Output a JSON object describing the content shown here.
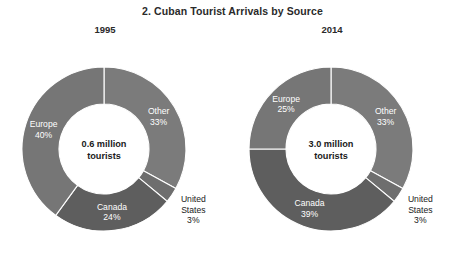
{
  "figure": {
    "title": "2. Cuban Tourist Arrivals by Source",
    "background_color": "#ffffff"
  },
  "chart_data": {
    "type": "pie",
    "title": "2. Cuban Tourist Arrivals by Source",
    "subtype": "donut",
    "legend": "none (direct slice labels)",
    "grid": false,
    "units": "percent of arrivals",
    "charts": [
      {
        "panel_label": "1995",
        "center_text_line1": "0.6 million",
        "center_text_line2": "tourists",
        "total_value": 0.6,
        "total_units": "million tourists",
        "categories": [
          "Other",
          "United States",
          "Canada",
          "Europe"
        ],
        "values": [
          33,
          3,
          24,
          40
        ],
        "slices": [
          {
            "name": "Other",
            "value": 33,
            "label": "Other",
            "value_label": "33%",
            "color": "#7b7b7b",
            "label_color": "#ffffff",
            "label_placement": "inside"
          },
          {
            "name": "United States",
            "value": 3,
            "label_line1": "United",
            "label_line2": "States",
            "value_label": "3%",
            "color": "#6e6e6e",
            "label_color": "#1a1a1a",
            "label_placement": "outside"
          },
          {
            "name": "Canada",
            "value": 24,
            "label": "Canada",
            "value_label": "24%",
            "color": "#5e5e5e",
            "label_color": "#ffffff",
            "label_placement": "inside"
          },
          {
            "name": "Europe",
            "value": 40,
            "label": "Europe",
            "value_label": "40%",
            "color": "#767676",
            "label_color": "#ffffff",
            "label_placement": "inside"
          }
        ]
      },
      {
        "panel_label": "2014",
        "center_text_line1": "3.0 million",
        "center_text_line2": "tourists",
        "total_value": 3.0,
        "total_units": "million tourists",
        "categories": [
          "Other",
          "United States",
          "Canada",
          "Europe"
        ],
        "values": [
          33,
          3,
          39,
          25
        ],
        "slices": [
          {
            "name": "Other",
            "value": 33,
            "label": "Other",
            "value_label": "33%",
            "color": "#7b7b7b",
            "label_color": "#ffffff",
            "label_placement": "inside"
          },
          {
            "name": "United States",
            "value": 3,
            "label_line1": "United",
            "label_line2": "States",
            "value_label": "3%",
            "color": "#6e6e6e",
            "label_color": "#1a1a1a",
            "label_placement": "outside"
          },
          {
            "name": "Canada",
            "value": 39,
            "label": "Canada",
            "value_label": "39%",
            "color": "#5e5e5e",
            "label_color": "#ffffff",
            "label_placement": "inside"
          },
          {
            "name": "Europe",
            "value": 25,
            "label": "Europe",
            "value_label": "25%",
            "color": "#767676",
            "label_color": "#ffffff",
            "label_placement": "inside"
          }
        ]
      }
    ]
  },
  "geometry": {
    "panels": [
      {
        "cx": 104,
        "cy": 149,
        "r_outer": 82,
        "r_inner": 45
      },
      {
        "cx": 331,
        "cy": 149,
        "r_outer": 82,
        "r_inner": 45
      }
    ],
    "start_angle_deg": 0
  }
}
